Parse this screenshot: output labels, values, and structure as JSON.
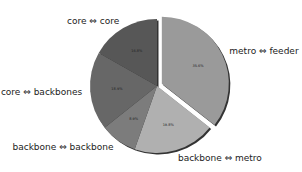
{
  "chart_data": {
    "type": "pie",
    "title": "",
    "categories": [
      "metro ⇔ feeder",
      "backbone ⇔ metro",
      "backbone ⇔ backbone",
      "core ⇔ backbones",
      "core ⇔ core"
    ],
    "values": [
      35.6,
      19.8,
      8.9,
      18.9,
      16.8
    ],
    "value_labels": [
      "35.6%",
      "19.8%",
      "8.9%",
      "18.9%",
      "16.8%"
    ],
    "colors": [
      "#9a9a9a",
      "#b0b0b0",
      "#7c7c7c",
      "#676767",
      "#575757"
    ],
    "explode": [
      0.08,
      0,
      0,
      0,
      0
    ],
    "start_angle": 90,
    "counterclock": false,
    "shadow": true,
    "legend": "none"
  }
}
